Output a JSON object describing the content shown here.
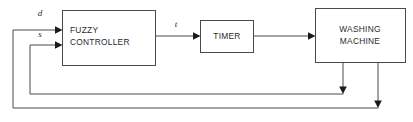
{
  "diagram": {
    "background_color": "#ffffff",
    "line_color": "#4a4a4a",
    "arrow_color": "#1a1a1a",
    "text_color": "#2b2b2b",
    "blocks": [
      {
        "id": "fuzzy-controller",
        "name": "fuzzy-controller-block",
        "lines": [
          "FUZZY",
          "CONTROLLER"
        ],
        "line1": "FUZZY",
        "line2": "CONTROLLER",
        "align": "left",
        "x": 62,
        "y": 10,
        "width": 93,
        "height": 55
      },
      {
        "id": "timer",
        "name": "timer-block",
        "lines": [
          "TIMER"
        ],
        "line1": "TIMER",
        "align": "center",
        "x": 200,
        "y": 20,
        "width": 53,
        "height": 32
      },
      {
        "id": "washing-machine",
        "name": "washing-machine-block",
        "lines": [
          "WASHING",
          "MACHINE"
        ],
        "line1": "WASHING",
        "line2": "MACHINE",
        "align": "center",
        "x": 315,
        "y": 8,
        "width": 90,
        "height": 54
      }
    ],
    "signals": [
      {
        "id": "signal-d",
        "name": "signal-label-d",
        "label": "d",
        "meaning": "input to fuzzy controller (upper)",
        "x": 40,
        "y": 16
      },
      {
        "id": "signal-s",
        "name": "signal-label-s",
        "label": "s",
        "meaning": "input to fuzzy controller (lower)",
        "x": 40,
        "y": 37
      },
      {
        "id": "signal-t",
        "name": "signal-label-t",
        "label": "t",
        "meaning": "fuzzy controller output to timer",
        "x": 176,
        "y": 27
      }
    ],
    "connections": [
      {
        "id": "conn-d-to-controller",
        "name": "wire-d-to-fuzzy-controller",
        "from": "feedback-outer",
        "to": "fuzzy-controller",
        "direction": "right"
      },
      {
        "id": "conn-s-to-controller",
        "name": "wire-s-to-fuzzy-controller",
        "from": "feedback-inner",
        "to": "fuzzy-controller",
        "direction": "right"
      },
      {
        "id": "conn-controller-to-timer",
        "name": "wire-fuzzy-controller-to-timer",
        "from": "fuzzy-controller",
        "to": "timer",
        "direction": "right"
      },
      {
        "id": "conn-timer-to-machine",
        "name": "wire-timer-to-washing-machine",
        "from": "timer",
        "to": "washing-machine",
        "direction": "right"
      },
      {
        "id": "conn-machine-feedback-inner",
        "name": "wire-washing-machine-feedback-inner",
        "from": "washing-machine",
        "to": "fuzzy-controller",
        "direction": "down-left-up"
      },
      {
        "id": "conn-machine-feedback-outer",
        "name": "wire-washing-machine-feedback-outer",
        "from": "washing-machine",
        "to": "fuzzy-controller",
        "direction": "down-left-up"
      }
    ]
  }
}
